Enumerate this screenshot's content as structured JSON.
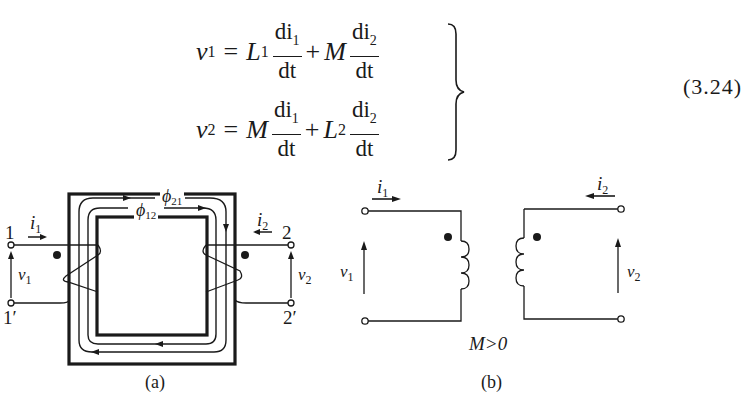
{
  "equations": {
    "number": "(3.24)",
    "line1": {
      "lhs": "v",
      "lhs_sub": "1",
      "eq": "=",
      "t1_coef": "L",
      "t1_coef_sub": "1",
      "t1_num": "di",
      "t1_num_sub": "1",
      "t1_den": "dt",
      "plus": "+",
      "t2_coef": "M",
      "t2_coef_sub": "",
      "t2_num": "di",
      "t2_num_sub": "2",
      "t2_den": "dt"
    },
    "line2": {
      "lhs": "v",
      "lhs_sub": "2",
      "eq": "=",
      "t1_coef": "M",
      "t1_coef_sub": "",
      "t1_num": "di",
      "t1_num_sub": "1",
      "t1_den": "dt",
      "plus": "+",
      "t2_coef": "L",
      "t2_coef_sub": "2",
      "t2_num": "di",
      "t2_num_sub": "2",
      "t2_den": "dt"
    }
  },
  "figure_a": {
    "caption": "(a)",
    "terminal_1": "1",
    "terminal_1p": "1′",
    "terminal_2": "2",
    "terminal_2p": "2′",
    "current_1": "i",
    "current_1_sub": "1",
    "current_2": "i",
    "current_2_sub": "2",
    "voltage_1": "v",
    "voltage_1_sub": "1",
    "voltage_2": "v",
    "voltage_2_sub": "2",
    "flux_21": "ϕ",
    "flux_21_sub": "21",
    "flux_12": "ϕ",
    "flux_12_sub": "12"
  },
  "figure_b": {
    "caption": "(b)",
    "condition": "M>0",
    "current_1": "i",
    "current_1_sub": "1",
    "current_2": "i",
    "current_2_sub": "2",
    "voltage_1": "v",
    "voltage_1_sub": "1",
    "voltage_2": "v",
    "voltage_2_sub": "2"
  },
  "colors": {
    "ink": "#1a1a1a",
    "background": "#ffffff"
  }
}
